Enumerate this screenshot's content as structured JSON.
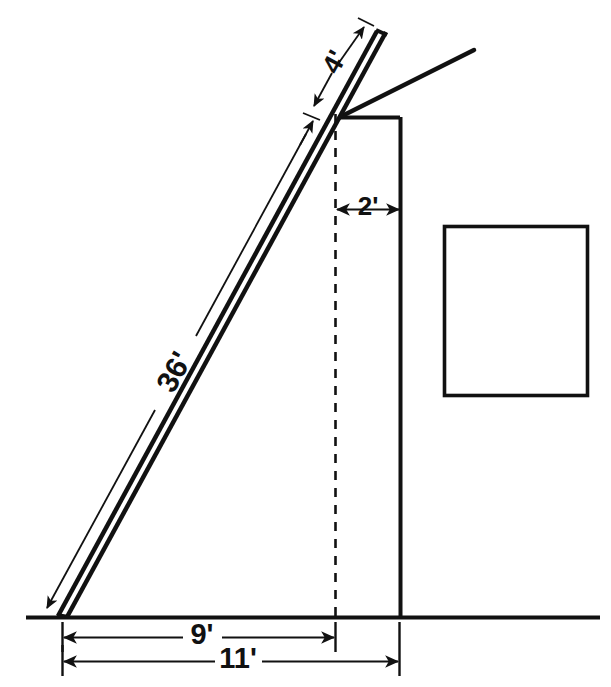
{
  "figure": {
    "background_color": "#ffffff",
    "line_color": "#111111"
  },
  "dimensions": {
    "ladder_length": {
      "label": "36'",
      "value": 36,
      "unit": "feet",
      "describes": "total ladder length from base to tip"
    },
    "ladder_extension": {
      "label": "4'",
      "value": 4,
      "unit": "feet",
      "describes": "ladder extension above roof contact point"
    },
    "wall_offset": {
      "label": "2'",
      "value": 2,
      "unit": "feet",
      "describes": "horizontal offset from dashed plumb line to building wall"
    },
    "base_to_plumb": {
      "label": "9'",
      "value": 9,
      "unit": "feet",
      "describes": "horizontal distance from ladder base to dashed plumb line"
    },
    "base_to_wall": {
      "label": "11'",
      "value": 11,
      "unit": "feet",
      "describes": "horizontal distance from ladder base to building wall"
    }
  },
  "elements": {
    "ladder": "ladder-double-rail",
    "ground": "ground-line",
    "building_wall": "building-wall-line",
    "building_roof_top": "building-roof-top-edge",
    "roof_slope": "roof-slope-line",
    "plumb_line": "dashed-plumb-line",
    "blank_box": "blank-square-box"
  }
}
